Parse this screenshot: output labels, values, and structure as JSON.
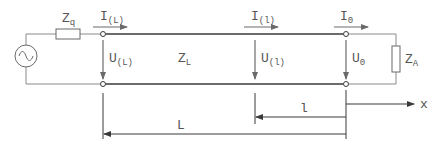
{
  "diagram": {
    "colors": {
      "line": "#3a3a3a",
      "thin_wire": "#8a8a8a",
      "text": "#555555",
      "background": "#ffffff"
    },
    "source": {
      "icon": "ac-source-icon",
      "symbol": "~"
    },
    "source_impedance": {
      "main": "Z",
      "sub": "q"
    },
    "line_impedance": {
      "main": "Z",
      "sub": "L"
    },
    "load_impedance": {
      "main": "Z",
      "sub": "A"
    },
    "currents": [
      {
        "main": "I",
        "sub": "(L)"
      },
      {
        "main": "I",
        "sub": "(l)"
      },
      {
        "main": "I",
        "sub": "0"
      }
    ],
    "voltages": [
      {
        "main": "U",
        "sub": "(L)"
      },
      {
        "main": "U",
        "sub": "(l)"
      },
      {
        "main": "U",
        "sub": "0"
      }
    ],
    "dimensions": {
      "short": "l",
      "long": "L",
      "axis": "x"
    }
  }
}
